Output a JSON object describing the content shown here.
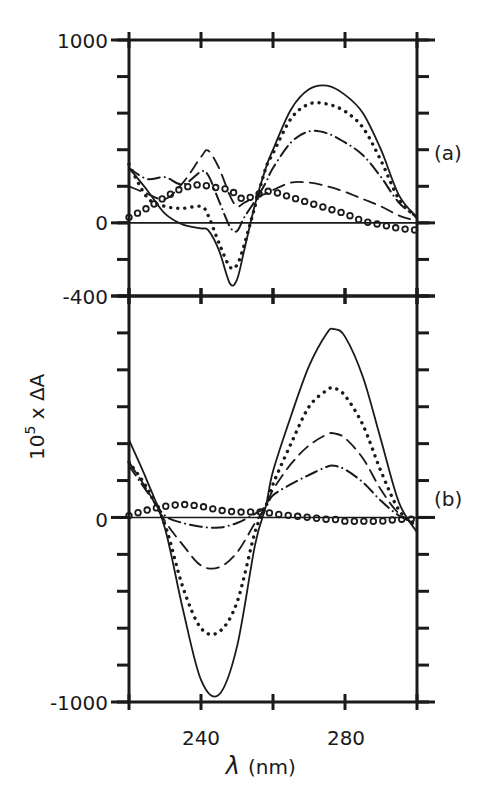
{
  "figure": {
    "ylabel": "10⁵ x ΔA",
    "ylabel_base": "10",
    "ylabel_exp": "5",
    "ylabel_rest": " x ΔA",
    "xlabel_symbol": "λ",
    "xlabel_unit": "(nm)",
    "x_tick_labels": [
      "240",
      "280"
    ],
    "panel_a_label": "(a)",
    "panel_b_label": "(b)",
    "panel_a_y_tick_labels": [
      "1000",
      "0",
      "-400"
    ],
    "panel_b_y_tick_labels": [
      "0",
      "-1000"
    ]
  },
  "chart_data": [
    {
      "type": "line",
      "panel": "(a)",
      "title": "",
      "xlabel": "λ (nm)",
      "ylabel": "10^5 x ΔA",
      "xlim": [
        220,
        300
      ],
      "ylim": [
        -400,
        1000
      ],
      "x_ticks": [
        220,
        240,
        260,
        280,
        300
      ],
      "y_ticks": [
        -400,
        -200,
        0,
        200,
        400,
        600,
        800,
        1000
      ],
      "grid": false,
      "legend": "none",
      "zero_line": true,
      "x": [
        220,
        225,
        230,
        235,
        240,
        242,
        245,
        248,
        250,
        252,
        255,
        258,
        260,
        265,
        270,
        275,
        280,
        285,
        290,
        295,
        300
      ],
      "series": [
        {
          "name": "solid",
          "style": "solid",
          "values": [
            300,
            180,
            50,
            -10,
            -30,
            -40,
            -150,
            -330,
            -310,
            -150,
            100,
            300,
            400,
            620,
            730,
            750,
            700,
            600,
            400,
            150,
            30
          ]
        },
        {
          "name": "dotted",
          "style": "dotted",
          "values": [
            320,
            140,
            90,
            80,
            90,
            40,
            -110,
            -240,
            -230,
            -120,
            90,
            300,
            380,
            570,
            650,
            650,
            610,
            520,
            340,
            130,
            30
          ]
        },
        {
          "name": "dash-dot",
          "style": "dashdot",
          "values": [
            300,
            240,
            250,
            210,
            280,
            260,
            120,
            -20,
            -45,
            30,
            120,
            220,
            300,
            440,
            500,
            490,
            440,
            370,
            250,
            110,
            30
          ]
        },
        {
          "name": "dashed",
          "style": "dashed",
          "values": [
            200,
            160,
            130,
            220,
            360,
            395,
            300,
            150,
            90,
            110,
            140,
            160,
            180,
            220,
            220,
            200,
            170,
            130,
            90,
            40,
            10
          ]
        },
        {
          "name": "circles",
          "style": "circles",
          "values": [
            30,
            80,
            140,
            190,
            210,
            200,
            190,
            180,
            150,
            130,
            150,
            170,
            170,
            140,
            110,
            80,
            50,
            10,
            -10,
            -30,
            -40
          ]
        }
      ]
    },
    {
      "type": "line",
      "panel": "(b)",
      "title": "",
      "xlabel": "λ (nm)",
      "ylabel": "10^5 x ΔA",
      "xlim": [
        220,
        300
      ],
      "ylim": [
        -1000,
        1200
      ],
      "x_ticks": [
        220,
        240,
        260,
        280,
        300
      ],
      "y_ticks": [
        -1000,
        -800,
        -600,
        -400,
        -200,
        0,
        200,
        400,
        600,
        800,
        1000,
        1200
      ],
      "grid": false,
      "legend": "none",
      "zero_line": true,
      "x": [
        220,
        225,
        230,
        235,
        240,
        245,
        250,
        255,
        258,
        260,
        265,
        270,
        275,
        277,
        280,
        285,
        290,
        295,
        300
      ],
      "series": [
        {
          "name": "solid",
          "style": "solid",
          "values": [
            420,
            200,
            -60,
            -500,
            -880,
            -960,
            -700,
            -150,
            60,
            250,
            550,
            820,
            1000,
            1020,
            980,
            760,
            420,
            80,
            -80
          ]
        },
        {
          "name": "dotted",
          "style": "dotted",
          "values": [
            300,
            160,
            -40,
            -380,
            -600,
            -620,
            -460,
            -80,
            60,
            180,
            400,
            600,
            690,
            700,
            660,
            500,
            250,
            40,
            -50
          ]
        },
        {
          "name": "dashed",
          "style": "dashed",
          "values": [
            300,
            150,
            -20,
            -150,
            -260,
            -270,
            -190,
            -30,
            60,
            150,
            290,
            390,
            450,
            455,
            430,
            320,
            150,
            20,
            -40
          ]
        },
        {
          "name": "dash-dot",
          "style": "dashdot",
          "values": [
            280,
            140,
            10,
            -30,
            -50,
            -55,
            -30,
            20,
            60,
            120,
            180,
            230,
            275,
            280,
            260,
            190,
            90,
            10,
            -30
          ]
        },
        {
          "name": "circles",
          "style": "circles",
          "values": [
            10,
            40,
            60,
            70,
            60,
            40,
            30,
            30,
            30,
            20,
            10,
            0,
            -10,
            -10,
            -20,
            -20,
            -20,
            -10,
            -10
          ]
        }
      ]
    }
  ]
}
